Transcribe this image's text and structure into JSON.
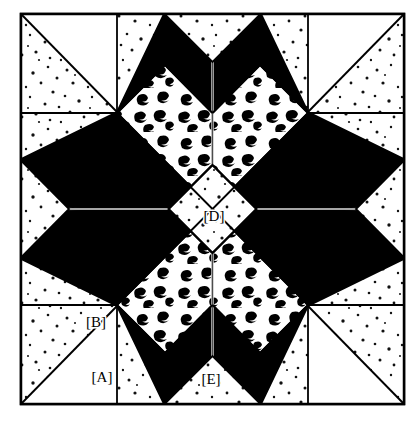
{
  "diagram": {
    "type": "quilt-block-pattern",
    "frame": {
      "x": 21,
      "y": 14,
      "width": 383,
      "height": 390,
      "stroke_color": "#000000",
      "stroke_width": 2.5,
      "fill_color": "#ffffff"
    },
    "colors": {
      "solid_dark": "#000000",
      "background_light": "#ffffff",
      "outline": "#000000",
      "fine_speckle_dot": "#111111",
      "bold_squiggle": "#000000"
    },
    "geometry": {
      "center_x": 212.5,
      "center_y": 209,
      "star_points": 8,
      "star_outer_radius": 191,
      "center_diamond_half_diagonal": 44
    },
    "fabrics": [
      {
        "key": "solid_dark",
        "name": "Solid Dark",
        "description": "plain black print"
      },
      {
        "key": "fine_speckle",
        "name": "Fine Speckle",
        "description": "light ground with small scattered dots"
      },
      {
        "key": "bold_squiggle",
        "name": "Bold Squiggle",
        "description": "light ground with heavy comma-shaped marks"
      },
      {
        "key": "plain_light",
        "name": "Plain Light",
        "description": "unmarked light ground"
      }
    ],
    "labels": [
      {
        "id": "A",
        "text": "[A]",
        "x": 102,
        "y": 379,
        "patch": "corner-speckled-triangle",
        "fabric": "fine_speckle"
      },
      {
        "id": "B",
        "text": "[B]",
        "x": 96,
        "y": 324,
        "patch": "corner-plain-triangle",
        "fabric": "plain_light"
      },
      {
        "id": "D",
        "text": "[D]",
        "x": 214,
        "y": 218,
        "patch": "center-diamond",
        "fabric": "fine_speckle"
      },
      {
        "id": "E",
        "text": "[E]",
        "x": 211,
        "y": 381,
        "patch": "edge-notch-triangle",
        "fabric": "fine_speckle"
      }
    ]
  }
}
